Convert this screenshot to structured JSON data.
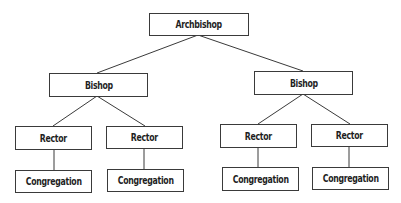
{
  "diagram": {
    "type": "org-chart",
    "root": {
      "label": "Archbishop",
      "children": [
        {
          "label": "Bishop",
          "children": [
            {
              "label": "Rector",
              "children": [
                {
                  "label": "Congregation"
                }
              ]
            },
            {
              "label": "Rector",
              "children": [
                {
                  "label": "Congregation"
                }
              ]
            }
          ]
        },
        {
          "label": "Bishop",
          "children": [
            {
              "label": "Rector",
              "children": [
                {
                  "label": "Congregation"
                }
              ]
            },
            {
              "label": "Rector",
              "children": [
                {
                  "label": "Congregation"
                }
              ]
            }
          ]
        }
      ]
    }
  },
  "nodes": {
    "archbishop": "Archbishop",
    "bishop_left": "Bishop",
    "bishop_right": "Bishop",
    "rector_1": "Rector",
    "rector_2": "Rector",
    "rector_3": "Rector",
    "rector_4": "Rector",
    "congregation_1": "Congregation",
    "congregation_2": "Congregation",
    "congregation_3": "Congregation",
    "congregation_4": "Congregation"
  },
  "colors": {
    "line": "#3a3a3a",
    "text": "#1e1e1e",
    "background": "#ffffff"
  }
}
